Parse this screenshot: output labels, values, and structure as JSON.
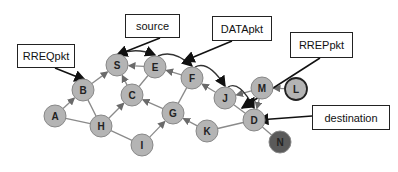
{
  "diagram": {
    "type": "network-routing",
    "nodes": [
      {
        "id": "A",
        "x": 55,
        "y": 116,
        "fill": "#b4b4b4"
      },
      {
        "id": "B",
        "x": 83,
        "y": 90,
        "fill": "#b4b4b4"
      },
      {
        "id": "S",
        "x": 117,
        "y": 65,
        "fill": "#b4b4b4"
      },
      {
        "id": "E",
        "x": 155,
        "y": 67,
        "fill": "#b4b4b4"
      },
      {
        "id": "C",
        "x": 132,
        "y": 95,
        "fill": "#b4b4b4"
      },
      {
        "id": "H",
        "x": 101,
        "y": 126,
        "fill": "#b4b4b4"
      },
      {
        "id": "I",
        "x": 142,
        "y": 145,
        "fill": "#b4b4b4"
      },
      {
        "id": "G",
        "x": 173,
        "y": 113,
        "fill": "#b4b4b4"
      },
      {
        "id": "F",
        "x": 192,
        "y": 78,
        "fill": "#b4b4b4"
      },
      {
        "id": "J",
        "x": 225,
        "y": 98,
        "fill": "#b4b4b4"
      },
      {
        "id": "M",
        "x": 262,
        "y": 88,
        "fill": "#b4b4b4"
      },
      {
        "id": "L",
        "x": 296,
        "y": 89,
        "fill": "#b4b4b4",
        "stroke": "#222"
      },
      {
        "id": "D",
        "x": 254,
        "y": 120,
        "fill": "#b4b4b4"
      },
      {
        "id": "K",
        "x": 207,
        "y": 131,
        "fill": "#b4b4b4"
      },
      {
        "id": "N",
        "x": 280,
        "y": 142,
        "fill": "#5a5a5a"
      }
    ],
    "edges": [
      {
        "from": "A",
        "to": "B",
        "arrow": true
      },
      {
        "from": "A",
        "to": "H",
        "arrow": false
      },
      {
        "from": "B",
        "to": "S",
        "arrow": true
      },
      {
        "from": "B",
        "to": "H",
        "arrow": false
      },
      {
        "from": "E",
        "to": "S",
        "arrow": true
      },
      {
        "from": "C",
        "to": "S",
        "arrow": true
      },
      {
        "from": "C",
        "to": "E",
        "arrow": false
      },
      {
        "from": "H",
        "to": "C",
        "arrow": true
      },
      {
        "from": "H",
        "to": "I",
        "arrow": false
      },
      {
        "from": "I",
        "to": "G",
        "arrow": true
      },
      {
        "from": "G",
        "to": "C",
        "arrow": true
      },
      {
        "from": "G",
        "to": "F",
        "arrow": false
      },
      {
        "from": "F",
        "to": "E",
        "arrow": true
      },
      {
        "from": "J",
        "to": "F",
        "arrow": true
      },
      {
        "from": "M",
        "to": "J",
        "arrow": true
      },
      {
        "from": "L",
        "to": "M",
        "arrow": true
      },
      {
        "from": "M",
        "to": "D",
        "arrow": true
      },
      {
        "from": "J",
        "to": "D",
        "arrow": false
      },
      {
        "from": "K",
        "to": "G",
        "arrow": true
      },
      {
        "from": "K",
        "to": "D",
        "arrow": false
      },
      {
        "from": "D",
        "to": "N",
        "arrow": false
      }
    ],
    "curved_data_path": [
      {
        "from": "S",
        "to": "E"
      },
      {
        "from": "E",
        "to": "F"
      },
      {
        "from": "F",
        "to": "J"
      },
      {
        "from": "J",
        "to": "D"
      }
    ],
    "colors": {
      "node_fill": "#b4b4b4",
      "node_stroke": "#888888",
      "destination_neighbor_fill": "#5a5a5a",
      "edge": "#8a8a8a",
      "callout_arrow": "#111111"
    }
  },
  "callouts": [
    {
      "id": "rreq",
      "label": "RREQpkt",
      "target": "B"
    },
    {
      "id": "source",
      "label": "source",
      "target": "S"
    },
    {
      "id": "data",
      "label": "DATApkt",
      "target": "F"
    },
    {
      "id": "rrep",
      "label": "RREPpkt",
      "target": "J"
    },
    {
      "id": "destination",
      "label": "destination",
      "target": "D"
    }
  ]
}
